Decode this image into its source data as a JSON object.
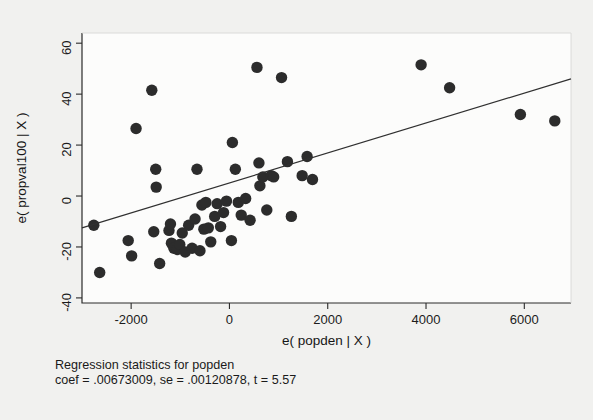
{
  "figure": {
    "background_color": "#f1f1ef",
    "plot_background_color": "#fcfcfb",
    "point_color": "#2c2c2c",
    "line_color": "#303030",
    "axis_color": "#2a2a2a"
  },
  "caption": {
    "line1": "Regression statistics for popden",
    "line2": "coef = .00673009, se = .00120878, t = 5.57"
  },
  "chart_data": {
    "type": "scatter",
    "title": "",
    "xlabel": "e( popden | X )",
    "ylabel": "e( propval100 | X )",
    "xlim": [
      -3000,
      6950
    ],
    "ylim": [
      -42,
      64
    ],
    "xticks": [
      -2000,
      0,
      2000,
      4000,
      6000
    ],
    "xtick_labels": [
      "-2000",
      "0",
      "2000",
      "4000",
      "6000"
    ],
    "yticks": [
      -40,
      -20,
      0,
      20,
      40,
      60
    ],
    "ytick_labels": [
      "-40",
      "-20",
      "0",
      "20",
      "40",
      "60"
    ],
    "grid": false,
    "legend": false,
    "marker": "filled-circle",
    "marker_size": 7,
    "points": [
      {
        "x": -2760,
        "y": -11.5
      },
      {
        "x": -2640,
        "y": -30.0
      },
      {
        "x": -2060,
        "y": -17.5
      },
      {
        "x": -1990,
        "y": -23.5
      },
      {
        "x": -1900,
        "y": 26.5
      },
      {
        "x": -1580,
        "y": 41.5
      },
      {
        "x": -1540,
        "y": -14.0
      },
      {
        "x": -1500,
        "y": 10.5
      },
      {
        "x": -1490,
        "y": 3.5
      },
      {
        "x": -1420,
        "y": -26.5
      },
      {
        "x": -1230,
        "y": -13.5
      },
      {
        "x": -1200,
        "y": -11.0
      },
      {
        "x": -1180,
        "y": -18.5
      },
      {
        "x": -1130,
        "y": -20.5
      },
      {
        "x": -1060,
        "y": -21.0
      },
      {
        "x": -1010,
        "y": -19.0
      },
      {
        "x": -960,
        "y": -14.5
      },
      {
        "x": -900,
        "y": -22.0
      },
      {
        "x": -830,
        "y": -11.5
      },
      {
        "x": -760,
        "y": -20.5
      },
      {
        "x": -700,
        "y": -9.0
      },
      {
        "x": -660,
        "y": 10.5
      },
      {
        "x": -600,
        "y": -21.5
      },
      {
        "x": -560,
        "y": -3.5
      },
      {
        "x": -520,
        "y": -13.0
      },
      {
        "x": -480,
        "y": -2.5
      },
      {
        "x": -430,
        "y": -12.5
      },
      {
        "x": -380,
        "y": -18.0
      },
      {
        "x": -300,
        "y": -8.0
      },
      {
        "x": -250,
        "y": -3.0
      },
      {
        "x": -180,
        "y": -12.0
      },
      {
        "x": -120,
        "y": -6.5
      },
      {
        "x": -60,
        "y": -2.0
      },
      {
        "x": 40,
        "y": -17.5
      },
      {
        "x": 60,
        "y": 21.0
      },
      {
        "x": 120,
        "y": 10.5
      },
      {
        "x": 180,
        "y": -2.5
      },
      {
        "x": 240,
        "y": -7.5
      },
      {
        "x": 330,
        "y": -1.0
      },
      {
        "x": 420,
        "y": -9.5
      },
      {
        "x": 560,
        "y": 50.5
      },
      {
        "x": 600,
        "y": 13.0
      },
      {
        "x": 620,
        "y": 4.0
      },
      {
        "x": 680,
        "y": 7.5
      },
      {
        "x": 760,
        "y": -5.5
      },
      {
        "x": 850,
        "y": 8.0
      },
      {
        "x": 900,
        "y": 7.5
      },
      {
        "x": 1060,
        "y": 46.5
      },
      {
        "x": 1180,
        "y": 13.5
      },
      {
        "x": 1260,
        "y": -8.0
      },
      {
        "x": 1480,
        "y": 8.0
      },
      {
        "x": 1580,
        "y": 15.5
      },
      {
        "x": 1690,
        "y": 6.5
      },
      {
        "x": 3900,
        "y": 51.5
      },
      {
        "x": 4480,
        "y": 42.5
      },
      {
        "x": 5920,
        "y": 32.0
      },
      {
        "x": 6620,
        "y": 29.5
      }
    ],
    "fit_line": {
      "x_start": -3000,
      "y_start": -12.5,
      "x_end": 6950,
      "y_end": 46.0,
      "slope": 0.00673009,
      "intercept": 7.69
    }
  }
}
